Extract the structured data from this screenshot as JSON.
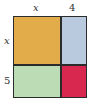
{
  "diagram": {
    "top_labels": [
      "x",
      "4"
    ],
    "side_labels": [
      "x",
      "5"
    ],
    "cells": [
      {
        "name": "x-by-x",
        "color": "#e3ac4a"
      },
      {
        "name": "x-by-4",
        "color": "#b9c9de"
      },
      {
        "name": "5-by-x",
        "color": "#bcdcb6"
      },
      {
        "name": "5-by-4",
        "color": "#d8284f"
      }
    ]
  }
}
